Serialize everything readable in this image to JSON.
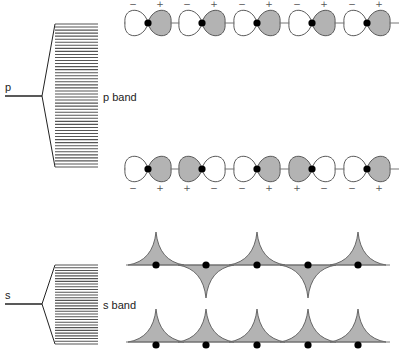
{
  "labels": {
    "p_level": "p",
    "p_band": "p band",
    "s_level": "s",
    "s_band": "s band"
  },
  "colors": {
    "lobe_fill_positive": "#b3b3b3",
    "lobe_fill_negative": "#ffffff",
    "outline": "#5a5a5a",
    "axis_line": "#777777",
    "nucleus": "#000000",
    "band_lines": "#555555"
  },
  "signs": {
    "plus": "+",
    "minus": "−"
  },
  "p_band": {
    "level_line": {
      "x1": 5,
      "x2": 42,
      "y": 96
    },
    "band_top": 24,
    "band_bottom": 167,
    "band_x1": 55,
    "band_x2": 98,
    "line_count": 48
  },
  "s_band": {
    "level_line": {
      "x1": 5,
      "x2": 42,
      "y": 304
    },
    "band_top": 265,
    "band_bottom": 344,
    "band_x1": 55,
    "band_x2": 98,
    "line_count": 30
  },
  "p_rows": [
    {
      "name": "p-orbitals-antibonding",
      "axis_y": 23,
      "sign_y": 7,
      "sign_position": "above",
      "nuclei_x": [
        148,
        202,
        257,
        312,
        367
      ],
      "right_lobe_positive": [
        true,
        true,
        true,
        true,
        true
      ]
    },
    {
      "name": "p-orbitals-bonding",
      "axis_y": 169,
      "sign_y": 191,
      "sign_position": "below",
      "nuclei_x": [
        148,
        202,
        257,
        312,
        367
      ],
      "right_lobe_positive": [
        true,
        false,
        true,
        false,
        true
      ]
    }
  ],
  "s_rows": [
    {
      "name": "s-orbitals-antibonding",
      "axis_y": 265,
      "nuclei_y": 265,
      "nuclei_x": [
        156,
        206,
        257,
        308,
        358
      ],
      "phase_up": [
        true,
        false,
        true,
        false,
        true
      ]
    },
    {
      "name": "s-orbitals-bonding",
      "axis_y": 342,
      "nuclei_y": 345,
      "nuclei_x": [
        156,
        206,
        257,
        308,
        358
      ],
      "phase_up": [
        true,
        true,
        true,
        true,
        true
      ]
    }
  ]
}
